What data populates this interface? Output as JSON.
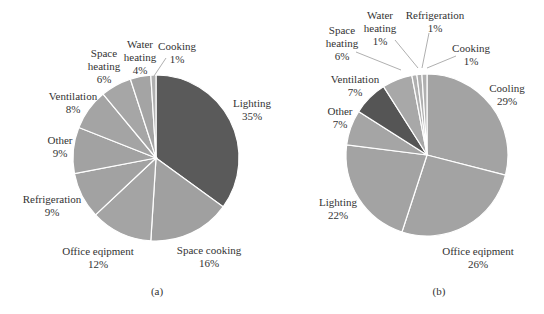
{
  "chart_data": [
    {
      "type": "pie",
      "title": "",
      "caption": "(a)",
      "center": [
        156,
        158
      ],
      "radius": 83,
      "start_angle_deg": 0,
      "direction": "clockwise",
      "slices": [
        {
          "name": "Lighting",
          "value": 35,
          "pct_label": "35%",
          "color": "#5a5a5a",
          "label_lines": [
            "Lighting"
          ],
          "label_pos": [
            252,
            97
          ]
        },
        {
          "name": "Space cooking",
          "value": 16,
          "pct_label": "16%",
          "color": "#a0a0a0",
          "label_lines": [
            "Space cooking"
          ],
          "label_pos": [
            209,
            244
          ]
        },
        {
          "name": "Office eqipment",
          "value": 12,
          "pct_label": "12%",
          "color": "#a4a4a4",
          "label_lines": [
            "Office eqipment"
          ],
          "label_pos": [
            98,
            245
          ]
        },
        {
          "name": "Refrigeration",
          "value": 9,
          "pct_label": "9%",
          "color": "#a2a2a2",
          "label_lines": [
            "Refrigeration"
          ],
          "label_pos": [
            52,
            193
          ]
        },
        {
          "name": "Other",
          "value": 9,
          "pct_label": "9%",
          "color": "#a2a2a2",
          "label_lines": [
            "Other"
          ],
          "label_pos": [
            60,
            134
          ]
        },
        {
          "name": "Ventilation",
          "value": 8,
          "pct_label": "8%",
          "color": "#a4a4a4",
          "label_lines": [
            "Ventilation"
          ],
          "label_pos": [
            73,
            90
          ]
        },
        {
          "name": "Space heating",
          "value": 6,
          "pct_label": "6%",
          "color": "#a6a6a6",
          "label_lines": [
            "Space",
            "heating"
          ],
          "label_pos": [
            104,
            47
          ]
        },
        {
          "name": "Water heating",
          "value": 4,
          "pct_label": "4%",
          "color": "#a4a4a4",
          "label_lines": [
            "Water",
            "heating"
          ],
          "label_pos": [
            140,
            38
          ]
        },
        {
          "name": "Cooking",
          "value": 1,
          "pct_label": "1%",
          "color": "#b0b0b0",
          "label_lines": [
            "Cooking"
          ],
          "label_pos": [
            177,
            40
          ]
        }
      ],
      "leader_lines": [
        {
          "slice": "Cooking",
          "from": [
            154,
            76
          ],
          "to": [
            166,
            58
          ]
        }
      ]
    },
    {
      "type": "pie",
      "title": "",
      "caption": "(b)",
      "center": [
        427,
        155
      ],
      "radius": 81,
      "start_angle_deg": 0,
      "direction": "clockwise",
      "slices": [
        {
          "name": "Cooling",
          "value": 29,
          "pct_label": "29%",
          "color": "#a3a3a3",
          "label_lines": [
            "Cooling"
          ],
          "label_pos": [
            507,
            82
          ]
        },
        {
          "name": "Office eqipment",
          "value": 26,
          "pct_label": "26%",
          "color": "#a3a3a3",
          "label_lines": [
            "Office eqipment"
          ],
          "label_pos": [
            478,
            245
          ]
        },
        {
          "name": "Lighting",
          "value": 22,
          "pct_label": "22%",
          "color": "#a3a3a3",
          "label_lines": [
            "Lighting"
          ],
          "label_pos": [
            338,
            196
          ]
        },
        {
          "name": "Other",
          "value": 7,
          "pct_label": "7%",
          "color": "#a5a5a5",
          "label_lines": [
            "Other"
          ],
          "label_pos": [
            340,
            105
          ]
        },
        {
          "name": "Ventilation",
          "value": 7,
          "pct_label": "7%",
          "color": "#555555",
          "label_lines": [
            "Ventilation"
          ],
          "label_pos": [
            355,
            73
          ]
        },
        {
          "name": "Space heating",
          "value": 6,
          "pct_label": "6%",
          "color": "#a8a8a8",
          "label_lines": [
            "Space",
            "heating"
          ],
          "label_pos": [
            342,
            24
          ]
        },
        {
          "name": "Water heating",
          "value": 1,
          "pct_label": "1%",
          "color": "#b0b0b0",
          "label_lines": [
            "Water",
            "heating"
          ],
          "label_pos": [
            380,
            9
          ]
        },
        {
          "name": "Refrigeration",
          "value": 1,
          "pct_label": "1%",
          "color": "#b0b0b0",
          "label_lines": [
            "Refrigeration"
          ],
          "label_pos": [
            435,
            9
          ]
        },
        {
          "name": "Cooking",
          "value": 1,
          "pct_label": "1%",
          "color": "#b0b0b0",
          "label_lines": [
            "Cooking"
          ],
          "label_pos": [
            471,
            42
          ]
        }
      ],
      "leader_lines": [
        {
          "slice": "Space heating",
          "from": [
            356,
            52
          ],
          "to": [
            401,
            70
          ]
        },
        {
          "slice": "Water heating",
          "from": [
            395,
            40
          ],
          "to": [
            418,
            68
          ]
        },
        {
          "slice": "Refrigeration",
          "from": [
            429,
            33
          ],
          "to": [
            422,
            68
          ]
        },
        {
          "slice": "Cooking",
          "from": [
            456,
            56
          ],
          "to": [
            427,
            68
          ]
        }
      ]
    }
  ]
}
